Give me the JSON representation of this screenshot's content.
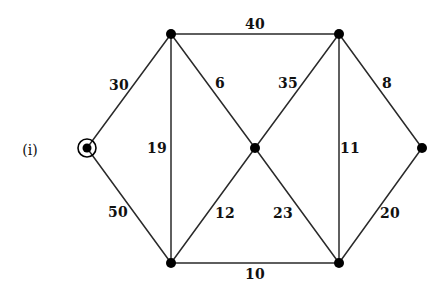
{
  "figure": {
    "label": "(i)",
    "label_x": 30,
    "label_y": 150,
    "width": 447,
    "height": 294,
    "background_color": "#ffffff",
    "edge_color": "#2a2a2a",
    "node_color": "#000000",
    "text_color": "#111111"
  },
  "chart_data": {
    "type": "diagram",
    "diagram_kind": "weighted-undirected-graph",
    "title": "(i)",
    "nodes": [
      {
        "id": "source",
        "name": "source-node",
        "x": 87,
        "y": 148,
        "shape": "double-circle",
        "radius": 4.5,
        "ring_radius": 9,
        "start": true
      },
      {
        "id": "tl",
        "name": "top-left-node",
        "x": 171,
        "y": 34,
        "shape": "dot",
        "radius": 5
      },
      {
        "id": "tr",
        "name": "top-right-node",
        "x": 339,
        "y": 34,
        "shape": "dot",
        "radius": 5
      },
      {
        "id": "center",
        "name": "center-node",
        "x": 255,
        "y": 148,
        "shape": "dot",
        "radius": 5
      },
      {
        "id": "right",
        "name": "right-node",
        "x": 422,
        "y": 148,
        "shape": "dot",
        "radius": 5
      },
      {
        "id": "bl",
        "name": "bottom-left-node",
        "x": 171,
        "y": 263,
        "shape": "dot",
        "radius": 5
      },
      {
        "id": "br",
        "name": "bottom-right-node",
        "x": 339,
        "y": 263,
        "shape": "dot",
        "radius": 5
      }
    ],
    "edges": [
      {
        "id": "e-source-tl",
        "from": "source",
        "to": "tl",
        "weight": 30,
        "label_x": 119,
        "label_y": 85
      },
      {
        "id": "e-source-bl",
        "from": "source",
        "to": "bl",
        "weight": 50,
        "label_x": 118,
        "label_y": 212
      },
      {
        "id": "e-tl-tr",
        "from": "tl",
        "to": "tr",
        "weight": 40,
        "label_x": 255,
        "label_y": 24
      },
      {
        "id": "e-tl-bl",
        "from": "tl",
        "to": "bl",
        "weight": 19,
        "label_x": 157,
        "label_y": 148
      },
      {
        "id": "e-tl-center",
        "from": "tl",
        "to": "center",
        "weight": 6,
        "label_x": 220,
        "label_y": 83
      },
      {
        "id": "e-tr-center",
        "from": "tr",
        "to": "center",
        "weight": 35,
        "label_x": 288,
        "label_y": 83
      },
      {
        "id": "e-tr-br",
        "from": "tr",
        "to": "br",
        "weight": 11,
        "label_x": 350,
        "label_y": 148
      },
      {
        "id": "e-tr-right",
        "from": "tr",
        "to": "right",
        "weight": 8,
        "label_x": 387,
        "label_y": 83
      },
      {
        "id": "e-center-bl",
        "from": "center",
        "to": "bl",
        "weight": 12,
        "label_x": 225,
        "label_y": 213
      },
      {
        "id": "e-center-br",
        "from": "center",
        "to": "br",
        "weight": 23,
        "label_x": 283,
        "label_y": 213
      },
      {
        "id": "e-bl-br",
        "from": "bl",
        "to": "br",
        "weight": 10,
        "label_x": 255,
        "label_y": 274
      },
      {
        "id": "e-right-br",
        "from": "right",
        "to": "br",
        "weight": 20,
        "label_x": 390,
        "label_y": 213
      }
    ]
  }
}
